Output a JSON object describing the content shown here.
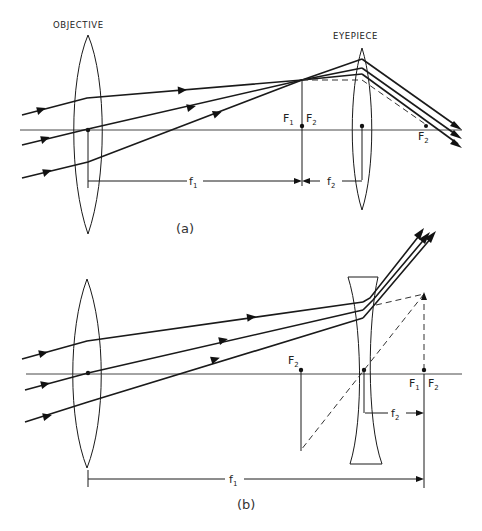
{
  "figure": {
    "type": "optics-diagram",
    "colors": {
      "ink": "#1a1a1a",
      "background": "#ffffff"
    }
  },
  "panel_a": {
    "caption": "(a)",
    "objective_label": "OBJECTIVE",
    "eyepiece_label": "EYEPIECE",
    "focal_points": [
      {
        "main": "F",
        "sub": "1"
      },
      {
        "main": "F",
        "sub": "2"
      },
      {
        "main": "F",
        "sub": "2"
      }
    ],
    "focal_lengths": [
      {
        "main": "f",
        "sub": "1"
      },
      {
        "main": "f",
        "sub": "2"
      }
    ]
  },
  "panel_b": {
    "caption": "(b)",
    "focal_points": [
      {
        "main": "F",
        "sub": "2"
      },
      {
        "main": "F",
        "sub": "1"
      },
      {
        "main": "F",
        "sub": "2"
      }
    ],
    "focal_lengths": [
      {
        "main": "f",
        "sub": "2"
      },
      {
        "main": "f",
        "sub": "1"
      }
    ]
  }
}
